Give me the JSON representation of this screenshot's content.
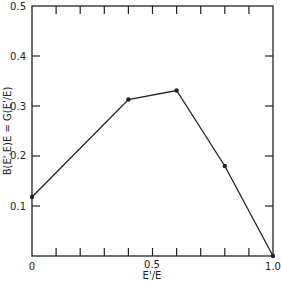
{
  "chart_data": {
    "type": "line",
    "title": "",
    "xlabel": "E'/E",
    "ylabel": "B(E',E)E = G(E'/E)",
    "xlim": [
      0,
      1.0
    ],
    "ylim": [
      0,
      0.5
    ],
    "x_tick_labels": [
      "0",
      "0.5",
      "1.0"
    ],
    "x_minor_ticks": [
      0.1,
      0.2,
      0.3,
      0.4,
      0.5,
      0.6,
      0.7,
      0.8,
      0.9
    ],
    "y_tick_labels": [
      "0.1",
      "0.2",
      "0.3",
      "0.4",
      "0.5"
    ],
    "grid": false,
    "legend": null,
    "series": [
      {
        "name": "G(E'/E)",
        "x": [
          0.0,
          0.4,
          0.6,
          0.8,
          1.0
        ],
        "y": [
          0.118,
          0.313,
          0.331,
          0.18,
          0.0
        ],
        "markers": true
      }
    ]
  }
}
